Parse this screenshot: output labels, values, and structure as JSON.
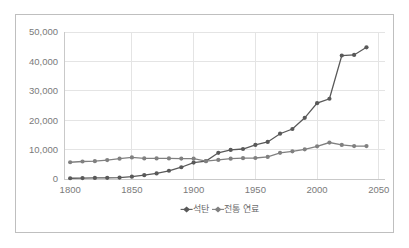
{
  "chart_data": {
    "type": "line",
    "title": "",
    "subtitle": "",
    "xlabel": "",
    "ylabel": "",
    "xlim": [
      1795,
      2055
    ],
    "ylim": [
      0,
      50000
    ],
    "xticks": [
      1800,
      1850,
      1900,
      1950,
      2000,
      2050
    ],
    "xtick_labels": [
      "1800",
      "1850",
      "1900",
      "1950",
      "2000",
      "2050"
    ],
    "yticks": [
      0,
      10000,
      20000,
      30000,
      40000,
      50000
    ],
    "ytick_labels": [
      "0",
      "10,000",
      "20,000",
      "30,000",
      "40,000",
      "50,000"
    ],
    "grid": "horizontal-and-vertical",
    "legend_position": "bottom",
    "markers": "filled-circle",
    "x": [
      1800,
      1810,
      1820,
      1830,
      1840,
      1850,
      1860,
      1870,
      1880,
      1890,
      1900,
      1910,
      1920,
      1930,
      1940,
      1950,
      1960,
      1970,
      1980,
      1990,
      2000,
      2010,
      2020,
      2030
    ],
    "series": [
      {
        "name": "석탄",
        "color": "#595959",
        "values": [
          250,
          300,
          350,
          400,
          500,
          800,
          1300,
          1900,
          2800,
          4000,
          5600,
          6100,
          8900,
          9900,
          10200,
          11600,
          12600,
          15400,
          17000,
          20800,
          25800,
          27300,
          42000,
          42200
        ]
      },
      {
        "name": "전통 연료",
        "color": "#808080",
        "values": [
          5700,
          5950,
          6050,
          6450,
          6900,
          7350,
          7000,
          7000,
          7000,
          6950,
          6900,
          6100,
          6500,
          6900,
          7100,
          7150,
          7500,
          8900,
          9400,
          10100,
          11100,
          12400,
          11600,
          11200
        ]
      }
    ],
    "extra_points": [
      {
        "series": "석탄",
        "x": 2040,
        "y": 44800
      },
      {
        "series": "전통 연료",
        "x": 2040,
        "y": 11200
      }
    ],
    "legend": [
      {
        "label": "석탄",
        "color": "#595959",
        "marker": "diamond"
      },
      {
        "label": "전통 연료",
        "color": "#808080",
        "marker": "diamond"
      }
    ]
  },
  "colors": {
    "frame_border": "#bfbfbf",
    "gridline": "#e4e4e4",
    "axis": "#c9c9c9",
    "tick_text": "#7a7a7a",
    "legend_text": "#6d6d6d",
    "series_1": "#595959",
    "series_2": "#808080",
    "background": "#ffffff"
  }
}
